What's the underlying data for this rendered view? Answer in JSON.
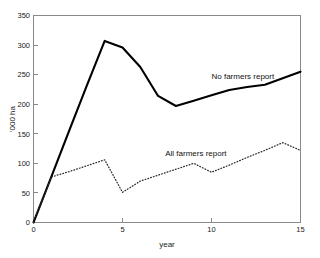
{
  "chart_data": {
    "type": "line",
    "title": "",
    "xlabel": "year",
    "ylabel": "'000 ha",
    "xlim": [
      0,
      15
    ],
    "ylim": [
      0,
      350
    ],
    "xticks": [
      0,
      5,
      10,
      15
    ],
    "xtick_labels": [
      "0",
      "5",
      "10",
      "15"
    ],
    "yticks": [
      0,
      50,
      100,
      150,
      200,
      250,
      300,
      350
    ],
    "ytick_labels": [
      "0",
      "50",
      "100",
      "150",
      "200",
      "250",
      "300",
      "350"
    ],
    "grid": false,
    "legend_position": "inline-annotation",
    "x": [
      0,
      1,
      2,
      3,
      4,
      5,
      6,
      7,
      8,
      9,
      10,
      11,
      12,
      13,
      14,
      15
    ],
    "series": [
      {
        "name": "No farmers report",
        "style": "solid",
        "color": "#000000",
        "values": [
          0,
          77,
          155,
          232,
          307,
          296,
          263,
          214,
          197,
          206,
          215,
          224,
          229,
          233,
          244,
          255
        ]
      },
      {
        "name": "All farmers report",
        "style": "dotted",
        "color": "#2b2b2b",
        "values": [
          0,
          77,
          86,
          96,
          106,
          51,
          70,
          80,
          90,
          100,
          85,
          97,
          110,
          122,
          135,
          122
        ]
      }
    ],
    "annotations": [
      {
        "text": "No farmers report",
        "x": 10.0,
        "y": 243
      },
      {
        "text": "All farmers report",
        "x": 7.4,
        "y": 113
      }
    ]
  },
  "axis": {
    "x_title": "year",
    "y_title": "'000 ha"
  }
}
